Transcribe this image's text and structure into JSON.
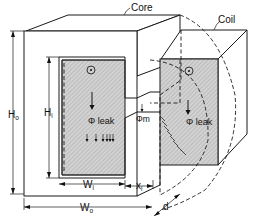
{
  "figure": {
    "type": "magnetic core with coil, leakage flux diagram",
    "labels": {
      "core": "Core",
      "coil": "Coil",
      "ho_main": "H",
      "ho_sub": "o",
      "hi_main": "H",
      "hi_sub": "i",
      "wi_main": "W",
      "wi_sub": "i",
      "wo_main": "W",
      "wo_sub": "o",
      "xi_main": "x",
      "xi_sub": "i",
      "d": "d",
      "phi_m": "Φm",
      "phi_leak_window": "Φ leak",
      "phi_leak_coil": "Φ leak",
      "current_dot": "⊙"
    },
    "colors": {
      "line": "#1a1a1a",
      "shading": "#c9c9c9",
      "background": "#ffffff"
    }
  }
}
